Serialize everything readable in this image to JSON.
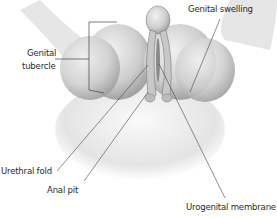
{
  "diagram": {
    "labels": [
      {
        "id": "genital-swelling",
        "text": "Genital swelling"
      },
      {
        "id": "genital-tubercle-1",
        "text": "Genital"
      },
      {
        "id": "genital-tubercle-2",
        "text": "tubercle"
      },
      {
        "id": "urethral-fold",
        "text": "Urethral fold"
      },
      {
        "id": "anal-pit",
        "text": "Anal pit"
      },
      {
        "id": "urogenital-membrane",
        "text": "Urogenital membrane"
      }
    ]
  }
}
